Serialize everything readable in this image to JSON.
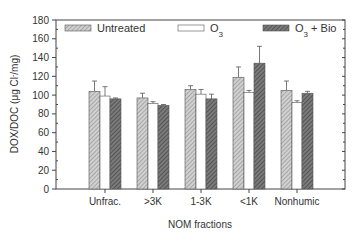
{
  "chart_data": {
    "type": "bar",
    "title": "",
    "xlabel": "NOM fractions",
    "ylabel": "DOX/DOC (μg Cl⁻/mg)",
    "ylim": [
      0,
      180
    ],
    "yticks": [
      0,
      20,
      40,
      60,
      80,
      100,
      120,
      140,
      160,
      180
    ],
    "grid": false,
    "legend_position": "top",
    "categories": [
      "Unfrac.",
      ">3K",
      "1-3K",
      "<1K",
      "Nonhumic"
    ],
    "series": [
      {
        "name": "Untreated",
        "fill": "light-hatched",
        "values": [
          104,
          97,
          106,
          119,
          105
        ],
        "errors": [
          11,
          5,
          4,
          11,
          10
        ]
      },
      {
        "name": "O3",
        "fill": "white",
        "values": [
          99,
          91,
          101,
          103,
          92
        ],
        "errors": [
          10,
          2,
          5,
          2,
          2
        ]
      },
      {
        "name": "O3 + Bio",
        "fill": "dark-hatched",
        "values": [
          96,
          89,
          96,
          134,
          102
        ],
        "errors": [
          1,
          1,
          5,
          18,
          2
        ]
      }
    ]
  },
  "legend": {
    "items": [
      {
        "label": "Untreated",
        "sub": "",
        "suffix": ""
      },
      {
        "label": "O",
        "sub": "3",
        "suffix": ""
      },
      {
        "label": "O",
        "sub": "3",
        "suffix": " + Bio"
      }
    ]
  },
  "axes": {
    "ylabel_main": "DOX/DOC (μg Cl",
    "ylabel_sup": "-",
    "ylabel_end": "/mg)",
    "xlabel": "NOM fractions"
  },
  "colors": {
    "axis": "#444444",
    "untreated_base": "#c8c8c8",
    "untreated_line": "#8a8a8a",
    "bio_base": "#6e6e6e",
    "bio_line": "#3a3a3a",
    "o3_fill": "#ffffff",
    "bar_stroke": "#555555"
  }
}
